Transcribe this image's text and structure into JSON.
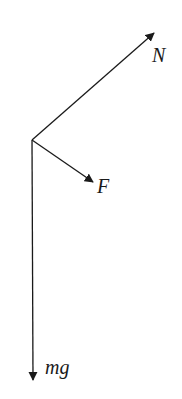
{
  "diagram": {
    "type": "free-body-diagram",
    "origin": [
      32,
      140
    ],
    "stroke_color": "#1a1a1a",
    "forces": [
      {
        "id": "N",
        "label": "N",
        "tip": [
          154,
          33
        ],
        "label_pos": [
          152,
          62
        ]
      },
      {
        "id": "F",
        "label": "F",
        "tip": [
          93,
          182
        ],
        "label_pos": [
          97,
          193
        ]
      },
      {
        "id": "mg",
        "label": "mg",
        "tip": [
          33,
          380
        ],
        "label_pos": [
          45,
          374
        ]
      }
    ]
  }
}
